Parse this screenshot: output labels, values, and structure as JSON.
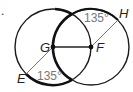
{
  "diagram": {
    "problem_marker": ".",
    "circles": [
      {
        "center": "G",
        "cx": 53,
        "cy": 47,
        "r": 38
      },
      {
        "center": "F",
        "cx": 91,
        "cy": 47,
        "r": 38
      }
    ],
    "points": {
      "G": {
        "label": "G",
        "x": 53,
        "y": 47
      },
      "F": {
        "label": "F",
        "x": 91,
        "y": 47
      },
      "E": {
        "label": "E",
        "x": 26,
        "y": 74
      },
      "H": {
        "label": "H",
        "x": 118,
        "y": 20
      }
    },
    "angles": {
      "top": {
        "label": "135°"
      },
      "bottom": {
        "label": "135°"
      }
    },
    "colors": {
      "stroke": "#1a1a1a",
      "thin_line": "#555555",
      "angle_text": "#777777"
    }
  }
}
